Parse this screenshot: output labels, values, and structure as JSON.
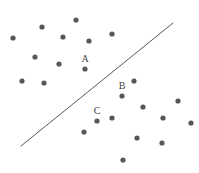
{
  "figure": {
    "width": 199,
    "height": 173,
    "background_color": "#ffffff"
  },
  "chart_data": {
    "type": "scatter",
    "title": "",
    "subtitle": "",
    "xlabel": "",
    "ylabel": "",
    "grid": false,
    "legend": "none",
    "axes_visible": false,
    "xlim": [
      0,
      199
    ],
    "ylim": [
      0,
      173
    ],
    "note": "Scatter of unlabeled points with a single straight decision-boundary line; three points are annotated A, B and C.",
    "point_style": {
      "color": "#575757",
      "radius": 2.6,
      "shape": "circle"
    },
    "points": [
      {
        "x": 13,
        "y": 38,
        "label": ""
      },
      {
        "x": 42,
        "y": 27,
        "label": ""
      },
      {
        "x": 35,
        "y": 57,
        "label": ""
      },
      {
        "x": 22,
        "y": 81,
        "label": ""
      },
      {
        "x": 44,
        "y": 83,
        "label": ""
      },
      {
        "x": 59,
        "y": 64,
        "label": ""
      },
      {
        "x": 63,
        "y": 37,
        "label": ""
      },
      {
        "x": 76,
        "y": 20,
        "label": ""
      },
      {
        "x": 89,
        "y": 41,
        "label": ""
      },
      {
        "x": 112,
        "y": 34,
        "label": ""
      },
      {
        "x": 85,
        "y": 69,
        "label": "A"
      },
      {
        "x": 134,
        "y": 81,
        "label": ""
      },
      {
        "x": 122,
        "y": 96,
        "label": "B"
      },
      {
        "x": 143,
        "y": 107,
        "label": ""
      },
      {
        "x": 97,
        "y": 121,
        "label": "C"
      },
      {
        "x": 112,
        "y": 118,
        "label": ""
      },
      {
        "x": 84,
        "y": 132,
        "label": ""
      },
      {
        "x": 178,
        "y": 101,
        "label": ""
      },
      {
        "x": 163,
        "y": 118,
        "label": ""
      },
      {
        "x": 191,
        "y": 123,
        "label": ""
      },
      {
        "x": 137,
        "y": 138,
        "label": ""
      },
      {
        "x": 162,
        "y": 143,
        "label": ""
      },
      {
        "x": 123,
        "y": 160,
        "label": ""
      }
    ],
    "annotations": [
      {
        "text": "A",
        "x": 85,
        "y": 64
      },
      {
        "text": "B",
        "x": 122,
        "y": 91
      },
      {
        "text": "C",
        "x": 97,
        "y": 116
      }
    ],
    "line": {
      "name": "decision-boundary",
      "x1": 21,
      "y1": 146,
      "x2": 173,
      "y2": 23,
      "color": "#5a5a5a",
      "width": 1
    }
  }
}
